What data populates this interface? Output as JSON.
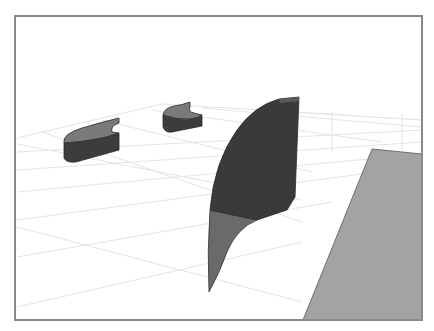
{
  "scene": {
    "type": "3d-model-viewport",
    "background": "#ffffff",
    "frame_color": "#8a8a8a",
    "grid_color": "#e6e6e6",
    "objects": [
      {
        "name": "curved-block-left",
        "top_color": "#7a7a7a",
        "side_color": "#3c3c3c"
      },
      {
        "name": "curved-block-middle",
        "top_color": "#7a7a7a",
        "side_color": "#3c3c3c"
      },
      {
        "name": "curved-fin",
        "upper_color": "#3a3a3a",
        "lower_color": "#6a6a6a"
      },
      {
        "name": "flat-plane",
        "color": "#a3a3a3",
        "edge_color": "#6e6e6e"
      }
    ]
  }
}
